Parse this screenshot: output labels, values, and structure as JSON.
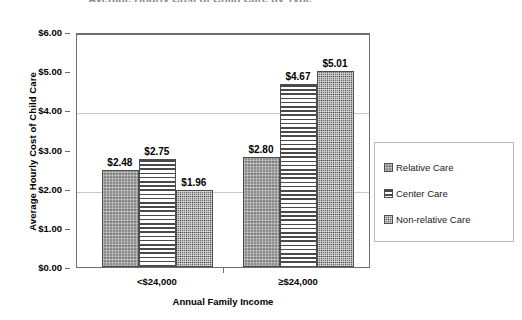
{
  "title_fragment": "Average Hourly Cost of Child Care by Type",
  "chart_data": {
    "type": "bar",
    "title": "",
    "xlabel": "Annual Family Income",
    "ylabel": "Average Hourly Cost of Child Care",
    "categories": [
      "<$24,000",
      "≥$24,000"
    ],
    "series": [
      {
        "name": "Relative Care",
        "values": [
          2.48,
          2.8
        ],
        "labels": [
          "$2.48",
          "$2.80"
        ],
        "pattern": "solid-gray-speckle"
      },
      {
        "name": "Center Care",
        "values": [
          2.75,
          4.67
        ],
        "labels": [
          "$2.75",
          "$4.67"
        ],
        "pattern": "horizontal-stripes"
      },
      {
        "name": "Non-relative Care",
        "values": [
          1.96,
          5.01
        ],
        "labels": [
          "$1.96",
          "$5.01"
        ],
        "pattern": "dense-speckle"
      }
    ],
    "ylim": [
      0,
      6
    ],
    "ytick_values": [
      0,
      1,
      2,
      3,
      4,
      5,
      6
    ],
    "ytick_labels": [
      "$0.00",
      "$1.00",
      "$2.00",
      "$3.00",
      "$4.00",
      "$5.00",
      "$6.00"
    ],
    "gridline_values": [
      2,
      4
    ],
    "grid": true,
    "legend_position": "right",
    "value_prefix": "$"
  },
  "legend": {
    "items": [
      {
        "label": "Relative Care"
      },
      {
        "label": "Center Care"
      },
      {
        "label": "Non-relative Care"
      }
    ]
  }
}
